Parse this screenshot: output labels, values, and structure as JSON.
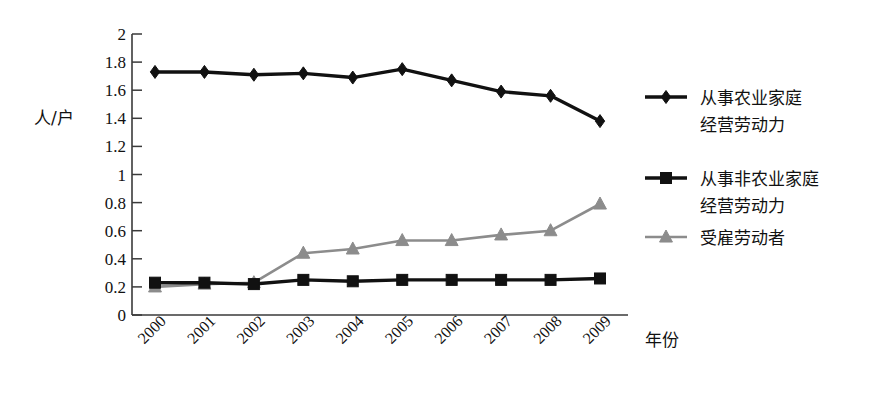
{
  "chart_data": {
    "type": "line",
    "title": "",
    "xlabel": "年份",
    "ylabel": "人/户",
    "x": [
      "2000",
      "2001",
      "2002",
      "2003",
      "2004",
      "2005",
      "2006",
      "2007",
      "2008",
      "2009"
    ],
    "categories": [
      "2000",
      "2001",
      "2002",
      "2003",
      "2004",
      "2005",
      "2006",
      "2007",
      "2008",
      "2009"
    ],
    "ylim": [
      0,
      2
    ],
    "xlim": [
      2000,
      2009
    ],
    "ytick_labels": [
      "0",
      "0.2",
      "0.4",
      "0.6",
      "0.8",
      "1",
      "1.2",
      "1.4",
      "1.6",
      "1.8",
      "2"
    ],
    "ytick_values": [
      0,
      0.2,
      0.4,
      0.6,
      0.8,
      1,
      1.2,
      1.4,
      1.6,
      1.8,
      2
    ],
    "grid": false,
    "legend_position": "right",
    "series": [
      {
        "name": "从事农业家庭经营劳动力",
        "name_line1": "从事农业家庭",
        "name_line2": "经营劳动力",
        "marker": "diamond",
        "color": "#111111",
        "values": [
          1.73,
          1.73,
          1.71,
          1.72,
          1.69,
          1.75,
          1.67,
          1.59,
          1.56,
          1.38
        ]
      },
      {
        "name": "从事非农业家庭经营劳动力",
        "name_line1": "从事非农业家庭",
        "name_line2": "经营劳动力",
        "marker": "square",
        "color": "#111111",
        "values": [
          0.23,
          0.23,
          0.22,
          0.25,
          0.24,
          0.25,
          0.25,
          0.25,
          0.25,
          0.26
        ]
      },
      {
        "name": "受雇劳动者",
        "name_line1": "受雇劳动者",
        "name_line2": "",
        "marker": "triangle",
        "color": "#8c8c8c",
        "values": [
          0.2,
          0.22,
          0.23,
          0.44,
          0.47,
          0.53,
          0.53,
          0.57,
          0.6,
          0.79
        ]
      }
    ]
  },
  "axes": {
    "y_label": "人/户",
    "x_label": "年份"
  },
  "colors": {
    "series1": "#111111",
    "series2": "#111111",
    "series3": "#8c8c8c",
    "axis": "#3a3a3a",
    "background": "#ffffff"
  }
}
